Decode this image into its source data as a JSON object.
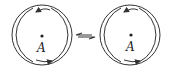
{
  "diagram": {
    "figures": [
      {
        "id": "left",
        "center_label": "A",
        "center": [
          42,
          35
        ],
        "outer_radius": 30
      },
      {
        "id": "right",
        "center_label": "A",
        "center": [
          130,
          35
        ],
        "outer_radius": 30
      }
    ],
    "connector": {
      "type": "double-headed-arrow",
      "from": [
        77,
        35
      ],
      "to": [
        97,
        35
      ]
    },
    "stroke_color": "#333333",
    "background": "#ffffff"
  }
}
